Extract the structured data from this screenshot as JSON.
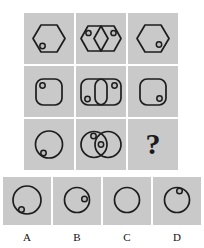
{
  "puzzle": {
    "type": "visual-analogy-matrix",
    "title": "",
    "colors": {
      "page_background": "#ffffff",
      "cell_background": "#c9c9c9",
      "stroke": "#1d1d1d",
      "dot_fill": "#bdbdbd"
    },
    "matrix": {
      "rows": 3,
      "columns": 3,
      "cells": [
        {
          "id": "r1c1",
          "shape": "hexagon",
          "count": 1,
          "dots": [
            "lower-left"
          ],
          "description": "hexagon with one small dot at lower left"
        },
        {
          "id": "r1c2",
          "shape": "hexagon",
          "count": 2,
          "dots": [
            "upper-left",
            "upper-right"
          ],
          "description": "two overlapping hexagons, a dot near the top of each"
        },
        {
          "id": "r1c3",
          "shape": "hexagon",
          "count": 1,
          "dots": [
            "lower-right"
          ],
          "description": "hexagon with one small dot at lower right"
        },
        {
          "id": "r2c1",
          "shape": "rounded-square",
          "count": 1,
          "dots": [
            "upper-left"
          ],
          "description": "rounded square with one small dot at upper left"
        },
        {
          "id": "r2c2",
          "shape": "rounded-square",
          "count": 2,
          "dots": [
            "lower-left",
            "upper-right"
          ],
          "description": "two overlapping rounded squares, dot lower left and dot upper right"
        },
        {
          "id": "r2c3",
          "shape": "rounded-square",
          "count": 1,
          "dots": [
            "lower-right"
          ],
          "description": "rounded square with one small dot at lower right"
        },
        {
          "id": "r3c1",
          "shape": "circle",
          "count": 1,
          "dots": [
            "lower-left"
          ],
          "description": "circle with one small dot at lower left"
        },
        {
          "id": "r3c2",
          "shape": "circle",
          "count": 2,
          "dots": [
            "upper-left",
            "center"
          ],
          "description": "two overlapping circles, dot at upper left and dot in the overlap"
        },
        {
          "id": "r3c3",
          "shape": "question-mark",
          "count": 0,
          "dots": [],
          "description": "missing tile shown as a question mark",
          "label": "?"
        }
      ]
    },
    "options": [
      {
        "label": "A",
        "shape": "circle",
        "size": "large",
        "dots": [
          "lower-left"
        ],
        "description": "large circle with one small dot at lower left"
      },
      {
        "label": "B",
        "shape": "circle",
        "size": "medium",
        "dots": [
          "right"
        ],
        "description": "circle with one small dot at middle right"
      },
      {
        "label": "C",
        "shape": "circle",
        "size": "medium",
        "dots": [],
        "description": "plain circle with no dot"
      },
      {
        "label": "D",
        "shape": "circle",
        "size": "medium",
        "dots": [
          "upper-right"
        ],
        "description": "circle with one small dot at upper right"
      }
    ]
  }
}
